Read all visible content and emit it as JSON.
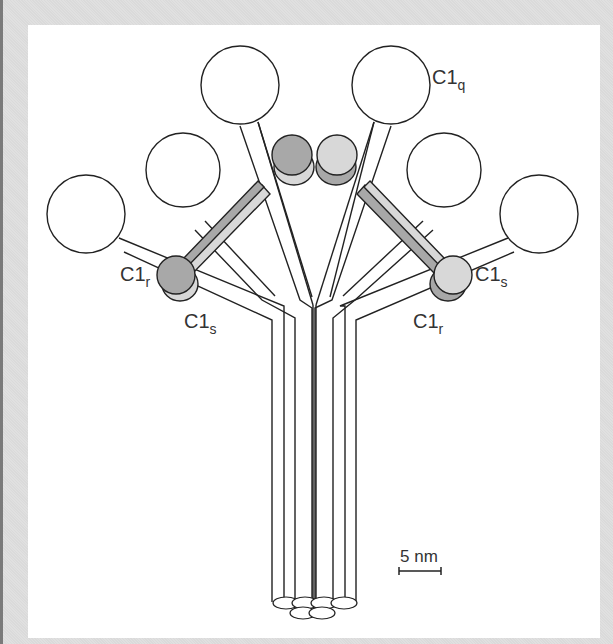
{
  "figure": {
    "colors": {
      "background_frame": "#dcdcdc",
      "panel": "#ffffff",
      "stroke": "#222222",
      "c1r_fill": "#a8a8a8",
      "c1s_fill": "#d8d8d8"
    },
    "labels": {
      "c1q": {
        "main": "C1",
        "sub": "q"
      },
      "c1r_left": {
        "main": "C1",
        "sub": "r"
      },
      "c1s_left": {
        "main": "C1",
        "sub": "s"
      },
      "c1s_right": {
        "main": "C1",
        "sub": "s"
      },
      "c1r_right": {
        "main": "C1",
        "sub": "r"
      }
    },
    "scale_bar": {
      "label": "5 nm"
    }
  }
}
